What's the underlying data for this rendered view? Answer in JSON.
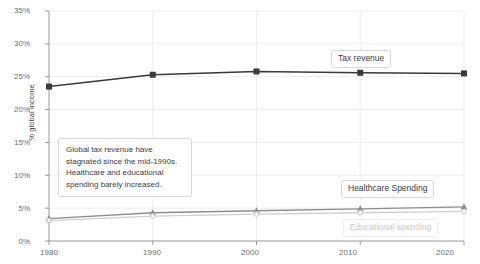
{
  "chart_data": {
    "type": "line",
    "title": "",
    "xlabel": "",
    "ylabel": "% global income",
    "x": [
      1980,
      1990,
      2000,
      2010,
      2020
    ],
    "xtick_labels": [
      "1980",
      "1990",
      "2000",
      "2010",
      "2020"
    ],
    "ytick_labels": [
      "0%",
      "5%",
      "10%",
      "15%",
      "20%",
      "25%",
      "30%",
      "35%"
    ],
    "ytick_values": [
      0,
      5,
      10,
      15,
      20,
      25,
      30,
      35
    ],
    "xlim": [
      1980,
      2020
    ],
    "ylim": [
      0,
      35
    ],
    "grid": true,
    "legend_position": "inline-labels",
    "series": [
      {
        "name": "Tax revenue",
        "values": [
          23.5,
          25.3,
          25.8,
          25.6,
          25.5
        ],
        "color": "#3a3a3a",
        "marker": "square"
      },
      {
        "name": "Healthcare Spending",
        "values": [
          3.4,
          4.3,
          4.6,
          4.9,
          5.2
        ],
        "color": "#8d8d8d",
        "marker": "triangle"
      },
      {
        "name": "Educational spending",
        "values": [
          3.1,
          3.8,
          4.1,
          4.3,
          4.5
        ],
        "color": "#cfcfcf",
        "marker": "circle"
      }
    ],
    "annotations": [
      {
        "text": "Global tax revenue have stagnated since the mid-1990s. Healthcare and educational spending barely increased."
      }
    ]
  },
  "labels": {
    "tax_revenue": "Tax revenue",
    "healthcare_spending": "Healthcare Spending",
    "educational_spending": "Educational spending",
    "y_axis": "% global income",
    "annotation_text": "Global tax revenue have stagnated since the mid-1990s. Healthcare and educational spending barely increased.",
    "ytick_0": "0%",
    "ytick_5": "5%",
    "ytick_10": "10%",
    "ytick_15": "15%",
    "ytick_20": "20%",
    "ytick_25": "25%",
    "ytick_30": "30%",
    "ytick_35": "35%",
    "xtick_1980": "1980",
    "xtick_1990": "1990",
    "xtick_2000": "2000",
    "xtick_2010": "2010",
    "xtick_2020": "2020"
  }
}
